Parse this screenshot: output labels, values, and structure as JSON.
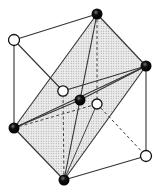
{
  "diagram": {
    "colors": {
      "line": "#333333",
      "shade": "#d9d9d9",
      "atom_filled": "#111111",
      "atom_open": "#ffffff"
    },
    "vertices": {
      "top": {
        "x": 97,
        "y": 14,
        "type": "filled"
      },
      "upper_left": {
        "x": 14,
        "y": 40,
        "type": "open"
      },
      "right": {
        "x": 146,
        "y": 66,
        "type": "filled"
      },
      "center_open": {
        "x": 63,
        "y": 91,
        "type": "open"
      },
      "center_filled": {
        "x": 80,
        "y": 100,
        "type": "filled"
      },
      "center_right_open": {
        "x": 97,
        "y": 104,
        "type": "open"
      },
      "left": {
        "x": 14,
        "y": 128,
        "type": "filled"
      },
      "lower_right": {
        "x": 146,
        "y": 156,
        "type": "open"
      },
      "bottom": {
        "x": 64,
        "y": 180,
        "type": "filled"
      }
    }
  }
}
